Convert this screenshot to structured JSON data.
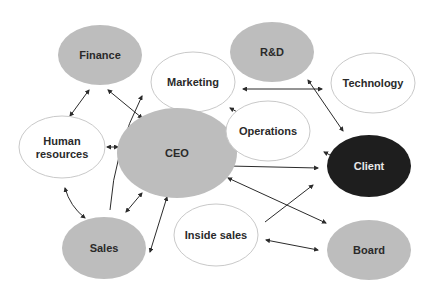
{
  "colors": {
    "gray_fill": "#bdbdbd",
    "white_fill": "#ffffff",
    "dark_fill": "#1e1e1e",
    "outline": "#c9c9c9",
    "arrow": "#2b2b2b",
    "text_dark": "#2a2a2a",
    "text_light": "#e8e8e8"
  },
  "nodes": [
    {
      "id": "finance",
      "label": "Finance",
      "style": "gray",
      "cx": 100,
      "cy": 55,
      "rx": 42,
      "ry": 30
    },
    {
      "id": "rnd",
      "label": "R&D",
      "style": "gray",
      "cx": 272,
      "cy": 52,
      "rx": 42,
      "ry": 30
    },
    {
      "id": "marketing",
      "label": "Marketing",
      "style": "white",
      "cx": 193,
      "cy": 82,
      "rx": 42,
      "ry": 30
    },
    {
      "id": "technology",
      "label": "Technology",
      "style": "white",
      "cx": 373,
      "cy": 83,
      "rx": 42,
      "ry": 30
    },
    {
      "id": "hr",
      "label": "Human resources",
      "lines": [
        "Human",
        "resources"
      ],
      "style": "white",
      "cx": 62,
      "cy": 147,
      "rx": 43,
      "ry": 31
    },
    {
      "id": "ceo",
      "label": "CEO",
      "style": "gray",
      "cx": 177,
      "cy": 153,
      "rx": 60,
      "ry": 45
    },
    {
      "id": "operations",
      "label": "Operations",
      "style": "white",
      "cx": 268,
      "cy": 131,
      "rx": 42,
      "ry": 30
    },
    {
      "id": "client",
      "label": "Client",
      "style": "dark",
      "cx": 369,
      "cy": 166,
      "rx": 42,
      "ry": 31
    },
    {
      "id": "sales",
      "label": "Sales",
      "style": "gray",
      "cx": 104,
      "cy": 248,
      "rx": 42,
      "ry": 31
    },
    {
      "id": "inside_sales",
      "label": "Inside sales",
      "style": "white",
      "cx": 216,
      "cy": 235,
      "rx": 42,
      "ry": 31
    },
    {
      "id": "board",
      "label": "Board",
      "style": "gray",
      "cx": 369,
      "cy": 250,
      "rx": 42,
      "ry": 30
    }
  ],
  "edges": [
    {
      "from": "finance",
      "to": "hr",
      "x1": 89,
      "y1": 90,
      "x2": 70,
      "y2": 116,
      "curve": 0
    },
    {
      "from": "finance",
      "to": "ceo",
      "x1": 108,
      "y1": 90,
      "x2": 142,
      "y2": 118,
      "curve": 0
    },
    {
      "from": "sales",
      "to": "marketing",
      "x1": 110,
      "y1": 210,
      "x2": 142,
      "y2": 96,
      "curve": -12,
      "start_arrow": false
    },
    {
      "from": "hr",
      "to": "ceo",
      "x1": 107,
      "y1": 147,
      "x2": 118,
      "y2": 147,
      "curve": 0
    },
    {
      "from": "hr",
      "to": "sales",
      "x1": 65,
      "y1": 188,
      "x2": 85,
      "y2": 218,
      "curve": 6
    },
    {
      "from": "sales",
      "to": "ceo",
      "x1": 126,
      "y1": 212,
      "x2": 142,
      "y2": 193,
      "curve": 0
    },
    {
      "from": "ceo",
      "to": "sales",
      "x1": 167,
      "y1": 197,
      "x2": 150,
      "y2": 252,
      "curve": 0
    },
    {
      "from": "marketing",
      "to": "operations",
      "x1": 230,
      "y1": 108,
      "x2": 241,
      "y2": 114,
      "curve": 0
    },
    {
      "from": "marketing",
      "to": "technology",
      "x1": 243,
      "y1": 89,
      "x2": 322,
      "y2": 89,
      "curve": 0
    },
    {
      "from": "rnd",
      "to": "client",
      "x1": 308,
      "y1": 80,
      "x2": 343,
      "y2": 131,
      "curve": 0
    },
    {
      "from": "operations",
      "to": "client",
      "x1": 324,
      "y1": 152,
      "x2": 336,
      "y2": 158,
      "curve": 0
    },
    {
      "from": "ceo",
      "to": "client",
      "x1": 229,
      "y1": 166,
      "x2": 318,
      "y2": 168,
      "curve": 0
    },
    {
      "from": "ceo",
      "to": "board",
      "x1": 228,
      "y1": 178,
      "x2": 326,
      "y2": 223,
      "curve": 0
    },
    {
      "from": "inside_sales",
      "to": "client",
      "x1": 265,
      "y1": 222,
      "x2": 313,
      "y2": 185,
      "curve": 0,
      "start_arrow": false
    },
    {
      "from": "inside_sales",
      "to": "board",
      "x1": 266,
      "y1": 240,
      "x2": 318,
      "y2": 250,
      "curve": 0
    }
  ]
}
